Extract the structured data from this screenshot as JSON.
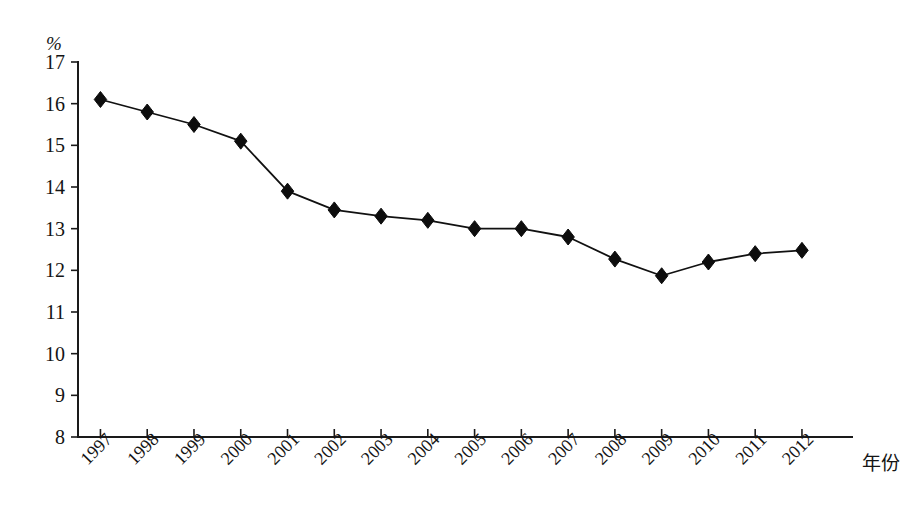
{
  "chart_data": {
    "type": "line",
    "title": "",
    "subtitle": "",
    "xlabel": "年份",
    "ylabel": "%",
    "unit_label": "%",
    "categories": [
      "1997",
      "1998",
      "1999",
      "2000",
      "2001",
      "2002",
      "2003",
      "2004",
      "2005",
      "2006",
      "2007",
      "2008",
      "2009",
      "2010",
      "2011",
      "2012"
    ],
    "series": [
      {
        "name": "",
        "values": [
          16.1,
          15.8,
          15.5,
          15.1,
          13.9,
          13.45,
          13.3,
          13.2,
          13.0,
          13.0,
          12.8,
          12.27,
          11.87,
          12.2,
          12.4,
          12.48
        ]
      }
    ],
    "ylim": [
      8,
      17
    ],
    "ytick_labels": [
      "17",
      "16",
      "15",
      "14",
      "13",
      "12",
      "11",
      "10",
      "9",
      "8"
    ],
    "ytick_values": [
      17,
      16,
      15,
      14,
      13,
      12,
      11,
      10,
      9,
      8
    ],
    "grid": false,
    "legend": false,
    "legend_position": "none",
    "marker": "diamond",
    "marker_color": "#0d0d0d",
    "line_color": "#111111",
    "background_color": "#ffffff",
    "xtick_rotation_deg": -45
  },
  "axes": {
    "y_axis_name": "percent-axis",
    "x_axis_name": "year-axis",
    "x_title": "年份",
    "y_unit": "%"
  }
}
